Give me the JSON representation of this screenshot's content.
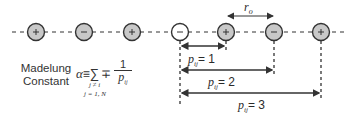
{
  "diagram": {
    "title_line1": "Madelung",
    "title_line2": "Constant",
    "formula": {
      "lhs": "α",
      "equiv": "≡",
      "sum": "∑",
      "sign": "∓",
      "numerator": "1",
      "denominator": "p",
      "denominator_sub": "ij",
      "sum_cond1": "j ≠ i",
      "sum_cond2": "j = 1, N"
    },
    "ions": [
      {
        "charge": "+",
        "x": 36,
        "fill": "#c8c8c8"
      },
      {
        "charge": "−",
        "x": 84,
        "fill": "#c8c8c8"
      },
      {
        "charge": "+",
        "x": 132,
        "fill": "#c8c8c8"
      },
      {
        "charge": "−",
        "x": 180,
        "fill": "#ffffff"
      },
      {
        "charge": "+",
        "x": 226,
        "fill": "#c8c8c8"
      },
      {
        "charge": "−",
        "x": 274,
        "fill": "#c8c8c8"
      },
      {
        "charge": "+",
        "x": 321,
        "fill": "#c8c8c8"
      }
    ],
    "spacing_label": "r",
    "spacing_sub": "o",
    "distances": [
      {
        "label": "p",
        "sub": "ij",
        "eq": "= 1"
      },
      {
        "label": "p",
        "sub": "ij",
        "eq": "= 2"
      },
      {
        "label": "p",
        "sub": "ij",
        "eq": "= 3"
      }
    ],
    "colors": {
      "ion_fill": "#c8c8c8",
      "reference_ion_fill": "#ffffff",
      "stroke": "#333333"
    }
  }
}
